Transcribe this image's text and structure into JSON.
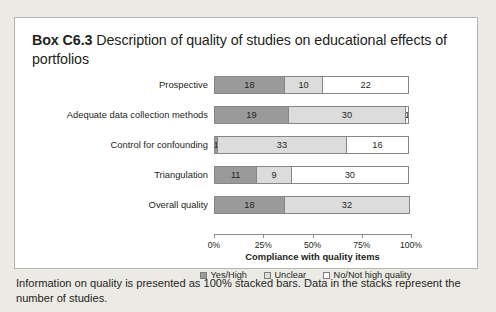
{
  "box": {
    "label": "Box C6.3",
    "title": " Description of quality of studies on educational effects of portfolios"
  },
  "caption": "Information on quality is presented as 100% stacked bars. Data in the stacks represent the number of studies.",
  "chart_data": {
    "type": "bar",
    "orientation": "horizontal",
    "stacked": true,
    "stack_mode": "100%",
    "title": "",
    "xlabel": "Compliance with quality items",
    "ylabel": "",
    "xlim": [
      0,
      100
    ],
    "xticks": [
      "0%",
      "25%",
      "50%",
      "75%",
      "100%"
    ],
    "xtick_values": [
      0,
      25,
      50,
      75,
      100
    ],
    "grid": false,
    "legend_position": "bottom",
    "stack_total": 50,
    "categories": [
      "Prospective",
      "Adequate data collection methods",
      "Control for confounding",
      "Triangulation",
      "Overall quality"
    ],
    "series": [
      {
        "name": "Yes/High",
        "color": "#9a9a9a",
        "values": [
          18,
          19,
          1,
          11,
          18
        ]
      },
      {
        "name": "Unclear",
        "color": "#dcdcdc",
        "values": [
          10,
          30,
          33,
          9,
          32
        ]
      },
      {
        "name": "No/Not high quality",
        "color": "#ffffff",
        "values": [
          22,
          1,
          16,
          30,
          0
        ]
      }
    ]
  }
}
